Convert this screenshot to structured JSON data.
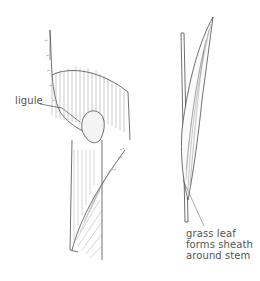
{
  "figure": {
    "labels": {
      "ligule": "ligule",
      "sheath_line1": "grass leaf",
      "sheath_line2": "forms sheath",
      "sheath_line3": "around stem"
    },
    "colors": {
      "ink": "#333333",
      "text": "#555555",
      "background": "#ffffff"
    }
  }
}
